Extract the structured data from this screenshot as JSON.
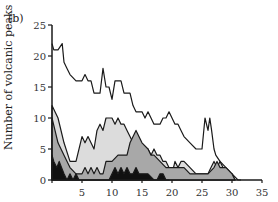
{
  "panel_label": "(b)",
  "chart_data": {
    "type": "area",
    "title": "",
    "xlabel": "",
    "ylabel": "Number of volcanic peaks",
    "xlim": [
      0,
      35
    ],
    "ylim": [
      0,
      25
    ],
    "xticks": [
      5,
      10,
      15,
      20,
      25,
      30,
      35
    ],
    "yticks": [
      0,
      5,
      10,
      15,
      20,
      25
    ],
    "grid": false,
    "legend": null,
    "series": [
      {
        "name": "total",
        "fill": "none",
        "x": [
          0,
          0.3,
          1,
          1.7,
          2,
          2.5,
          3,
          4,
          5,
          5.5,
          6,
          6.5,
          7,
          7.5,
          8,
          8.5,
          9,
          9.5,
          10,
          10.5,
          11,
          11.5,
          12,
          12.5,
          13,
          13.5,
          14,
          14.5,
          15,
          15.5,
          16,
          16.5,
          17,
          17.5,
          18,
          18.5,
          19,
          19.5,
          20,
          20.5,
          21,
          21.5,
          22,
          23,
          24,
          25,
          25.5,
          26,
          26.3,
          26.6,
          27,
          27.3,
          28,
          29,
          30,
          31,
          31.5
        ],
        "y": [
          22,
          21,
          21,
          22,
          19,
          18,
          17,
          16,
          16,
          17,
          16,
          16,
          14,
          14,
          14,
          18,
          15,
          15,
          13,
          16,
          16,
          16,
          14,
          14,
          14,
          12,
          11,
          11,
          11,
          10,
          11,
          10,
          9,
          9,
          9,
          10,
          10,
          11,
          10,
          9,
          9,
          8,
          7,
          6,
          5,
          5,
          10,
          8,
          10,
          8,
          5,
          4,
          3,
          2,
          1,
          0,
          0
        ]
      },
      {
        "name": "light-grey",
        "fill": "#dcdcdc",
        "x": [
          0,
          0.5,
          1,
          2,
          3,
          4,
          5,
          5.5,
          6,
          6.5,
          7,
          7.5,
          8,
          8.5,
          9,
          9.5,
          10,
          10.5,
          11,
          11.5,
          12,
          12.5,
          13,
          13.5,
          14,
          14.5,
          15,
          15.5,
          16,
          16.5,
          17,
          17.5,
          18,
          18.5,
          19,
          20,
          20.5,
          21,
          21.5,
          22,
          23,
          24,
          25,
          26,
          26.5,
          27,
          27.5,
          28,
          28.5,
          29,
          30,
          30.5
        ],
        "y": [
          12,
          11,
          10,
          6,
          3,
          3,
          7,
          6,
          7,
          6,
          5,
          8,
          9,
          8,
          10,
          10,
          10,
          9,
          10,
          9,
          9,
          8,
          7,
          6,
          5,
          5,
          5,
          4,
          5,
          4,
          5,
          4,
          4,
          3,
          3,
          1,
          3,
          2,
          3,
          3,
          2,
          1,
          1,
          1,
          2,
          3,
          2,
          3,
          2,
          1,
          1,
          0
        ]
      },
      {
        "name": "mid-grey",
        "fill": "#a8a8a8",
        "x": [
          0,
          0.5,
          1,
          1.5,
          2,
          3,
          4,
          5,
          5.5,
          6,
          6.5,
          7,
          7.5,
          8,
          8.5,
          9,
          10,
          11,
          12,
          12.5,
          13,
          14,
          15,
          16,
          16.5,
          17,
          18,
          19,
          20,
          21,
          22,
          23,
          24,
          25,
          26,
          27,
          27.5,
          28,
          29,
          30,
          30.5
        ],
        "y": [
          10,
          8,
          6,
          5,
          4,
          2,
          1,
          1,
          2,
          1,
          2,
          1,
          2,
          1,
          1,
          3,
          3,
          4,
          4,
          4,
          6,
          8,
          6,
          5,
          4,
          4,
          3,
          2,
          2,
          2,
          2,
          1,
          1,
          1,
          1,
          2,
          3,
          2,
          2,
          1,
          0
        ]
      },
      {
        "name": "black",
        "fill": "#111111",
        "x": [
          0,
          0.3,
          0.8,
          1.2,
          1.6,
          2,
          2.5,
          3,
          3.5,
          4,
          4.5,
          5,
          9.5,
          10,
          10.5,
          11,
          11.5,
          12,
          12.5,
          13,
          13.5,
          14,
          14.5,
          15,
          16,
          17,
          17.5,
          18,
          18.5,
          19,
          19.5
        ],
        "y": [
          4,
          3,
          2,
          3,
          2,
          1,
          0,
          1,
          0,
          1,
          0,
          0,
          0,
          1,
          2,
          1,
          2,
          1,
          2,
          1,
          1,
          2,
          1,
          1,
          1,
          0,
          0,
          1,
          1,
          0,
          0
        ]
      }
    ]
  },
  "axis": {
    "x_tick_labels": [
      "5",
      "10",
      "15",
      "20",
      "25",
      "30",
      "35"
    ],
    "y_tick_labels": [
      "0",
      "5",
      "10",
      "15",
      "20",
      "25"
    ]
  }
}
